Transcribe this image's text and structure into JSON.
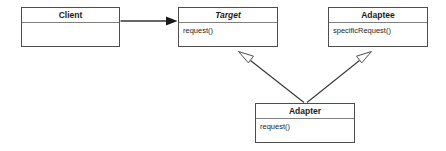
{
  "diagram": {
    "type": "uml-class-diagram",
    "background_color": "#ffffff",
    "border_color": "#4d4d4d",
    "divider_color": "#808080",
    "line_color": "#333333",
    "text_color": "#1a1a1a",
    "classes": [
      {
        "id": "client",
        "name": "Client",
        "abstract": false,
        "members": []
      },
      {
        "id": "target",
        "name": "Target",
        "abstract": true,
        "members": [
          "request()"
        ]
      },
      {
        "id": "adaptee",
        "name": "Adaptee",
        "abstract": false,
        "members": [
          "specificRequest()"
        ]
      },
      {
        "id": "adapter",
        "name": "Adapter",
        "abstract": false,
        "members": [
          "request()"
        ]
      }
    ],
    "relationships": [
      {
        "id": "client-target",
        "from": "Client",
        "to": "Target",
        "type": "association",
        "arrowhead": "solid-filled",
        "line": "solid"
      },
      {
        "id": "adapter-target",
        "from": "Adapter",
        "to": "Target",
        "type": "generalization",
        "arrowhead": "hollow-triangle",
        "line": "solid"
      },
      {
        "id": "adapter-adaptee",
        "from": "Adapter",
        "to": "Adaptee",
        "type": "generalization",
        "arrowhead": "hollow-triangle",
        "line": "solid"
      }
    ]
  }
}
